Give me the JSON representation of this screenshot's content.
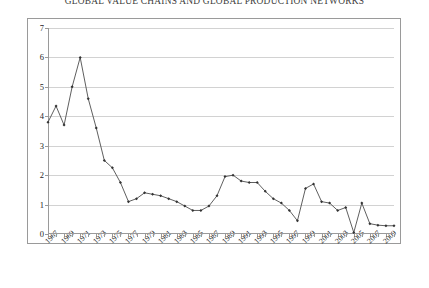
{
  "document": {
    "header_title": "GLOBAL VALUE CHAINS AND GLOBAL PRODUCTION NETWORKS"
  },
  "chart_data": {
    "type": "line",
    "title": "",
    "xlabel": "",
    "ylabel": "",
    "ylim": [
      0,
      7
    ],
    "ytick_step": 1,
    "yticks": [
      0,
      1,
      2,
      3,
      4,
      5,
      6,
      7
    ],
    "grid": true,
    "legend": "none",
    "marker": "diamond",
    "xlim": [
      1967,
      2010
    ],
    "x": [
      1967,
      1968,
      1969,
      1970,
      1971,
      1972,
      1973,
      1974,
      1975,
      1976,
      1977,
      1978,
      1979,
      1980,
      1981,
      1982,
      1983,
      1984,
      1985,
      1986,
      1987,
      1988,
      1989,
      1990,
      1991,
      1992,
      1993,
      1994,
      1995,
      1996,
      1997,
      1998,
      1999,
      2000,
      2001,
      2002,
      2003,
      2004,
      2005,
      2006,
      2007,
      2008,
      2009,
      2010
    ],
    "values": [
      3.8,
      4.35,
      3.7,
      5.0,
      6.0,
      4.6,
      3.6,
      2.5,
      2.25,
      1.75,
      1.1,
      1.2,
      1.4,
      1.35,
      1.3,
      1.2,
      1.1,
      0.95,
      0.8,
      0.8,
      0.95,
      1.3,
      1.95,
      2.0,
      1.8,
      1.75,
      1.75,
      1.45,
      1.2,
      1.05,
      0.8,
      0.45,
      1.55,
      1.7,
      1.1,
      1.05,
      0.8,
      0.9,
      0.05,
      1.05,
      0.35,
      0.3,
      0.28,
      0.28
    ],
    "xtick_labels": [
      "1967",
      "1969",
      "1971",
      "1973",
      "1975",
      "1977",
      "1979",
      "1981",
      "1983",
      "1985",
      "1987",
      "1989",
      "1991",
      "1993",
      "1995",
      "1997",
      "1999",
      "2001",
      "2003",
      "2005",
      "2007",
      "2009"
    ],
    "series_color": "#4d4d4d",
    "gridline_color": "#d2d2d2",
    "axis_color": "#9a9a9a"
  }
}
